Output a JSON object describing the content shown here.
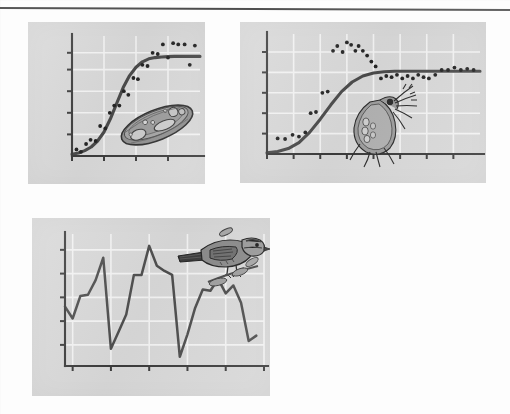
{
  "figure": {
    "panels": [
      {
        "id": "bacteria",
        "organism_label": "bacterium",
        "pattern_label": "logistic growth to carrying capacity"
      },
      {
        "id": "daphnia",
        "organism_label": "daphnia water flea",
        "pattern_label": "overshoot and damped oscillation"
      },
      {
        "id": "sparrow",
        "organism_label": "song sparrow",
        "pattern_label": "irregular fluctuation"
      }
    ],
    "colors": {
      "panel_background": "#d7d7d7",
      "page_background": "#fdfdfd",
      "gridline": "#f2f2f2",
      "axis": "#3b3b3b",
      "curve": "#4a4a4a",
      "datapoint": "#242424"
    }
  },
  "chart_data": [
    {
      "type": "scatter",
      "id": "bacteria",
      "title": "",
      "xlabel": "",
      "ylabel": "",
      "xlim": [
        0,
        10
      ],
      "ylim": [
        0,
        10
      ],
      "grid": true,
      "legend": null,
      "xticks": [
        0,
        2.5,
        5,
        7.5
      ],
      "yticks": [
        1.8,
        3.6,
        5.4,
        7.2,
        8.6
      ],
      "curve": {
        "name": "logistic fit",
        "model": "logistic",
        "x": [
          0.0,
          0.5,
          1.0,
          1.5,
          2.0,
          2.5,
          3.0,
          3.5,
          4.0,
          4.5,
          5.0,
          5.5,
          6.0,
          6.5,
          7.0,
          7.5,
          8.0,
          8.5,
          9.0,
          9.5,
          10.0
        ],
        "y": [
          0.15,
          0.25,
          0.45,
          0.75,
          1.25,
          2.0,
          3.1,
          4.4,
          5.7,
          6.7,
          7.4,
          7.85,
          8.1,
          8.2,
          8.25,
          8.28,
          8.3,
          8.3,
          8.3,
          8.3,
          8.3
        ]
      },
      "points": {
        "name": "observed counts",
        "x": [
          0.35,
          0.7,
          1.1,
          1.45,
          1.85,
          2.2,
          2.6,
          2.95,
          3.3,
          3.7,
          4.05,
          4.4,
          4.8,
          5.15,
          5.5,
          5.9,
          6.3,
          6.7,
          7.1,
          7.5,
          7.9,
          8.3,
          8.8,
          9.2,
          9.6
        ],
        "y": [
          0.55,
          0.35,
          1.0,
          1.35,
          1.25,
          2.5,
          2.3,
          3.6,
          4.2,
          4.2,
          5.4,
          5.1,
          6.5,
          6.4,
          7.6,
          7.5,
          8.6,
          8.5,
          9.3,
          8.2,
          9.4,
          9.3,
          9.3,
          7.6,
          9.2
        ]
      }
    },
    {
      "type": "scatter",
      "id": "daphnia",
      "title": "",
      "xlabel": "",
      "ylabel": "",
      "xlim": [
        0,
        10
      ],
      "ylim": [
        0,
        10
      ],
      "grid": true,
      "legend": null,
      "xticks": [
        0,
        1.25,
        2.5,
        3.75,
        5,
        6.25,
        7.5,
        8.75
      ],
      "yticks": [
        1.7,
        3.4,
        5.1,
        6.8,
        8.5
      ],
      "curve": {
        "name": "logistic fit",
        "model": "logistic",
        "x": [
          0.0,
          0.5,
          1.0,
          1.5,
          2.0,
          2.5,
          3.0,
          3.5,
          4.0,
          4.5,
          5.0,
          5.5,
          6.0,
          6.5,
          7.0,
          7.5,
          8.0,
          8.5,
          9.0,
          9.5,
          10.0
        ],
        "y": [
          0.1,
          0.2,
          0.45,
          0.95,
          1.8,
          2.9,
          4.1,
          5.2,
          6.0,
          6.5,
          6.75,
          6.85,
          6.9,
          6.9,
          6.9,
          6.9,
          6.9,
          6.9,
          6.9,
          6.9,
          6.9
        ]
      },
      "points": {
        "name": "observed counts",
        "x": [
          0.5,
          0.85,
          1.2,
          1.5,
          1.8,
          2.05,
          2.3,
          2.6,
          2.85,
          3.1,
          3.3,
          3.55,
          3.75,
          3.95,
          4.15,
          4.3,
          4.5,
          4.7,
          4.9,
          5.1,
          5.35,
          5.6,
          5.85,
          6.1,
          6.35,
          6.6,
          6.85,
          7.1,
          7.35,
          7.6,
          7.9,
          8.2,
          8.5,
          8.8,
          9.1,
          9.4,
          9.7
        ],
        "y": [
          1.3,
          1.25,
          1.6,
          1.45,
          1.8,
          3.4,
          3.5,
          5.1,
          5.2,
          8.6,
          9.0,
          8.5,
          9.3,
          9.1,
          8.6,
          9.0,
          8.6,
          8.2,
          7.7,
          7.3,
          6.3,
          6.5,
          6.4,
          6.6,
          6.3,
          6.5,
          6.3,
          6.6,
          6.4,
          6.3,
          6.6,
          7.0,
          7.0,
          7.2,
          7.0,
          7.1,
          7.0
        ]
      }
    },
    {
      "type": "line",
      "id": "sparrow",
      "title": "",
      "xlabel": "",
      "ylabel": "",
      "xlim": [
        0,
        26
      ],
      "ylim": [
        0,
        10
      ],
      "grid": true,
      "legend": null,
      "xticks": [
        1,
        6,
        11,
        16,
        21,
        26
      ],
      "yticks": [
        1.6,
        3.4,
        5.2,
        7.0,
        8.8
      ],
      "series": [
        {
          "name": "population count",
          "x": [
            0,
            1,
            2,
            3,
            4,
            5,
            6,
            7,
            8,
            9,
            10,
            11,
            12,
            13,
            14,
            15,
            16,
            17,
            18,
            19,
            20,
            21,
            22,
            23,
            24,
            25
          ],
          "y": [
            4.5,
            3.6,
            5.3,
            5.4,
            6.5,
            8.2,
            1.3,
            2.6,
            3.9,
            6.9,
            6.9,
            9.1,
            7.6,
            7.2,
            6.9,
            0.7,
            2.4,
            4.4,
            5.8,
            5.7,
            6.6,
            5.5,
            6.1,
            4.8,
            1.9,
            2.3
          ]
        }
      ]
    }
  ]
}
